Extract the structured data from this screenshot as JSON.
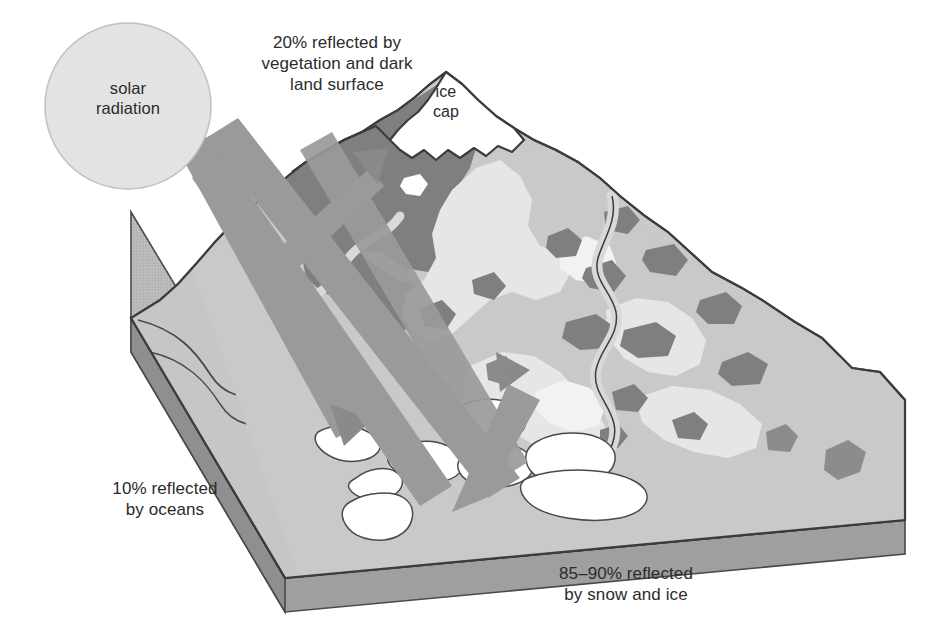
{
  "diagram": {
    "type": "illustration",
    "background_color": "#ffffff",
    "outline_color": "#3c3c3c"
  },
  "sun": {
    "label": "solar\nradiation",
    "shape": "circle",
    "fill_color": "#e3e3e3",
    "stroke_color": "#bdbdbd",
    "center_x": 128,
    "center_y": 106,
    "radius": 83
  },
  "labels": {
    "vegetation": "20% reflected by\nvegetation and dark\nland surface",
    "ice_cap": "ice\ncap",
    "oceans": "10% reflected\nby oceans",
    "snow_ice": "85–90% reflected\nby snow and ice"
  },
  "reflectance_values": [
    {
      "surface": "vegetation and dark land surface",
      "percent_text": "20%",
      "percent_low": 20,
      "percent_high": 20
    },
    {
      "surface": "oceans",
      "percent_text": "10%",
      "percent_low": 10,
      "percent_high": 10
    },
    {
      "surface": "snow and ice",
      "percent_text": "85–90%",
      "percent_low": 85,
      "percent_high": 90
    }
  ],
  "rays": {
    "incoming_count": 3,
    "reflected_count": 3,
    "fill_color": "#9a9a9a",
    "arrowhead_color": "#8a8a8a",
    "names": [
      "incoming-ray-to-dark-land",
      "incoming-ray-to-ocean",
      "incoming-ray-to-snow",
      "reflected-ray-from-dark-land",
      "reflected-ray-from-ocean",
      "reflected-ray-from-snow"
    ]
  },
  "terrain": {
    "block_top_color": "#c9c9c9",
    "block_front_color": "#adadad",
    "block_base_color": "#9f9f9f",
    "ocean_color": "#c6c6c6",
    "land_light_color": "#c3c3c3",
    "land_dark_color": "#808080",
    "snow_color": "#e8e8e8",
    "ice_white": "#ffffff",
    "river_color": "#d7d7d7",
    "features": [
      "ice-cap-peak",
      "dark-vegetated-slope",
      "snow-field",
      "meandering-river",
      "ocean-block",
      "pack-ice-floes",
      "rock-strata-band"
    ]
  }
}
